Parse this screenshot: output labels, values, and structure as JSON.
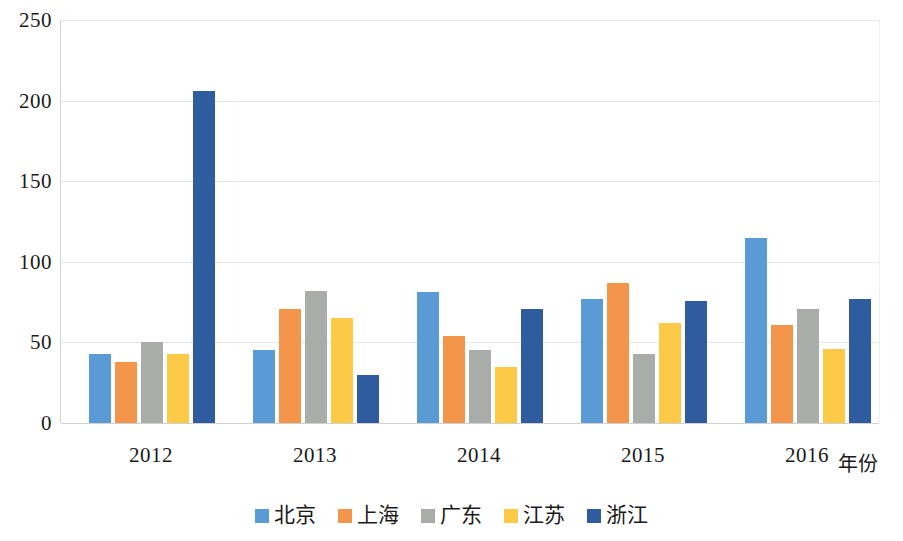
{
  "chart_data": {
    "type": "bar",
    "title": "",
    "subtitle": "",
    "xlabel": "年份",
    "ylabel": "",
    "categories": [
      "2012",
      "2013",
      "2014",
      "2015",
      "2016"
    ],
    "series": [
      {
        "name": "北京",
        "color": "#5B9BD5",
        "values": [
          43,
          45,
          81,
          77,
          115
        ]
      },
      {
        "name": "上海",
        "color": "#F3954B",
        "values": [
          38,
          71,
          54,
          87,
          61
        ]
      },
      {
        "name": "广东",
        "color": "#A9ADA9",
        "values": [
          50,
          82,
          45,
          43,
          71
        ]
      },
      {
        "name": "江苏",
        "color": "#FCCA47",
        "values": [
          43,
          65,
          35,
          62,
          46
        ]
      },
      {
        "name": "浙江",
        "color": "#2E5C9E",
        "values": [
          206,
          30,
          71,
          76,
          77
        ]
      }
    ],
    "ylim": [
      0,
      250
    ],
    "yticks": [
      0,
      50,
      100,
      150,
      200,
      250
    ],
    "ytick_labels": [
      "0",
      "50",
      "100",
      "150",
      "200",
      "250"
    ],
    "grid": true,
    "legend_position": "bottom",
    "annotations": []
  }
}
